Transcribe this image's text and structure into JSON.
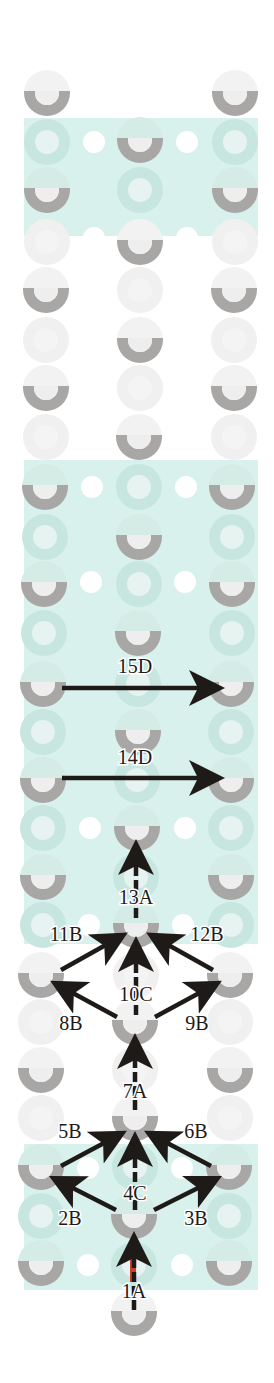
{
  "colors": {
    "background": "#ffffff",
    "band": "#d8f1ec",
    "band_shade": "#c9e9e2",
    "bead_solid": "#a9a7a6",
    "bead_hole": "#eeeeee",
    "bead_faded": "#f0f0f0",
    "bead_faded_in_band": "#c6e6df",
    "dot": "#ffffff",
    "arrow": "#1e1a18",
    "thread_tail": "#c8422b"
  },
  "bands": [
    {
      "y": 118,
      "h": 118
    },
    {
      "y": 460,
      "h": 484
    },
    {
      "y": 1144,
      "h": 146
    }
  ],
  "band_x": 24,
  "band_w": 234,
  "beads": [
    {
      "x": 47,
      "y": 93,
      "solid": true
    },
    {
      "x": 235,
      "y": 93,
      "solid": true
    },
    {
      "x": 140,
      "y": 140,
      "solid": true
    },
    {
      "x": 47,
      "y": 142,
      "solid": false
    },
    {
      "x": 235,
      "y": 142,
      "solid": false
    },
    {
      "x": 47,
      "y": 190,
      "solid": true
    },
    {
      "x": 235,
      "y": 190,
      "solid": true
    },
    {
      "x": 140,
      "y": 190,
      "solid": false
    },
    {
      "x": 140,
      "y": 242,
      "solid": true
    },
    {
      "x": 47,
      "y": 242,
      "solid": false
    },
    {
      "x": 235,
      "y": 242,
      "solid": false
    },
    {
      "x": 46,
      "y": 290,
      "solid": true
    },
    {
      "x": 234,
      "y": 290,
      "solid": true
    },
    {
      "x": 140,
      "y": 290,
      "solid": false
    },
    {
      "x": 140,
      "y": 340,
      "solid": true
    },
    {
      "x": 46,
      "y": 340,
      "solid": false
    },
    {
      "x": 234,
      "y": 340,
      "solid": false
    },
    {
      "x": 46,
      "y": 388,
      "solid": true
    },
    {
      "x": 234,
      "y": 388,
      "solid": true
    },
    {
      "x": 140,
      "y": 388,
      "solid": false
    },
    {
      "x": 139,
      "y": 437,
      "solid": true
    },
    {
      "x": 46,
      "y": 437,
      "solid": false
    },
    {
      "x": 234,
      "y": 437,
      "solid": false
    },
    {
      "x": 45,
      "y": 487,
      "solid": true
    },
    {
      "x": 232,
      "y": 487,
      "solid": true
    },
    {
      "x": 139,
      "y": 487,
      "solid": false
    },
    {
      "x": 139,
      "y": 537,
      "solid": true
    },
    {
      "x": 45,
      "y": 537,
      "solid": false
    },
    {
      "x": 232,
      "y": 537,
      "solid": false
    },
    {
      "x": 44,
      "y": 584,
      "solid": true
    },
    {
      "x": 232,
      "y": 584,
      "solid": true
    },
    {
      "x": 139,
      "y": 584,
      "solid": false
    },
    {
      "x": 138,
      "y": 633,
      "solid": true
    },
    {
      "x": 44,
      "y": 633,
      "solid": false
    },
    {
      "x": 232,
      "y": 633,
      "solid": false
    },
    {
      "x": 43,
      "y": 684,
      "solid": true
    },
    {
      "x": 231,
      "y": 684,
      "solid": true
    },
    {
      "x": 138,
      "y": 684,
      "solid": false
    },
    {
      "x": 138,
      "y": 732,
      "solid": true
    },
    {
      "x": 43,
      "y": 732,
      "solid": false
    },
    {
      "x": 231,
      "y": 732,
      "solid": false
    },
    {
      "x": 43,
      "y": 780,
      "solid": true
    },
    {
      "x": 231,
      "y": 780,
      "solid": true
    },
    {
      "x": 137,
      "y": 780,
      "solid": false
    },
    {
      "x": 137,
      "y": 828,
      "solid": true
    },
    {
      "x": 43,
      "y": 828,
      "solid": false
    },
    {
      "x": 231,
      "y": 828,
      "solid": false
    },
    {
      "x": 43,
      "y": 877,
      "solid": true
    },
    {
      "x": 231,
      "y": 877,
      "solid": true
    },
    {
      "x": 136,
      "y": 877,
      "solid": false
    },
    {
      "x": 136,
      "y": 925,
      "solid": true
    },
    {
      "x": 43,
      "y": 925,
      "solid": false
    },
    {
      "x": 231,
      "y": 925,
      "solid": false
    },
    {
      "x": 41,
      "y": 975,
      "solid": true
    },
    {
      "x": 230,
      "y": 975,
      "solid": true
    },
    {
      "x": 136,
      "y": 975,
      "solid": false
    },
    {
      "x": 135,
      "y": 1022,
      "solid": true
    },
    {
      "x": 41,
      "y": 1022,
      "solid": false
    },
    {
      "x": 230,
      "y": 1022,
      "solid": false
    },
    {
      "x": 41,
      "y": 1070,
      "solid": true
    },
    {
      "x": 230,
      "y": 1070,
      "solid": true
    },
    {
      "x": 135,
      "y": 1070,
      "solid": false
    },
    {
      "x": 135,
      "y": 1118,
      "solid": true
    },
    {
      "x": 41,
      "y": 1118,
      "solid": false
    },
    {
      "x": 230,
      "y": 1118,
      "solid": false
    },
    {
      "x": 41,
      "y": 1167,
      "solid": true
    },
    {
      "x": 229,
      "y": 1167,
      "solid": true
    },
    {
      "x": 135,
      "y": 1167,
      "solid": false
    },
    {
      "x": 134,
      "y": 1216,
      "solid": true
    },
    {
      "x": 41,
      "y": 1216,
      "solid": false
    },
    {
      "x": 229,
      "y": 1216,
      "solid": false
    },
    {
      "x": 41,
      "y": 1263,
      "solid": true
    },
    {
      "x": 229,
      "y": 1263,
      "solid": true
    },
    {
      "x": 134,
      "y": 1265,
      "solid": false
    },
    {
      "x": 134,
      "y": 1313,
      "solid": true
    }
  ],
  "dots": [
    {
      "x": 94,
      "y": 142
    },
    {
      "x": 187,
      "y": 142
    },
    {
      "x": 94,
      "y": 238
    },
    {
      "x": 187,
      "y": 238
    },
    {
      "x": 92,
      "y": 487
    },
    {
      "x": 186,
      "y": 487
    },
    {
      "x": 91,
      "y": 582
    },
    {
      "x": 185,
      "y": 582
    },
    {
      "x": 90,
      "y": 828
    },
    {
      "x": 185,
      "y": 828
    },
    {
      "x": 89,
      "y": 925
    },
    {
      "x": 183,
      "y": 925
    },
    {
      "x": 88,
      "y": 1168
    },
    {
      "x": 182,
      "y": 1168
    },
    {
      "x": 88,
      "y": 1265
    },
    {
      "x": 182,
      "y": 1265
    }
  ],
  "steps": [
    {
      "id": "1A",
      "label": "1A",
      "x1": 134,
      "y1": 1310,
      "x2": 134,
      "y2": 1240,
      "dashed": true,
      "lx": 134,
      "ly": 1298
    },
    {
      "id": "2B",
      "label": "2B",
      "x1": 116,
      "y1": 1210,
      "x2": 57,
      "y2": 1180,
      "dashed": false,
      "lx": 70,
      "ly": 1225
    },
    {
      "id": "3B",
      "label": "3B",
      "x1": 154,
      "y1": 1210,
      "x2": 214,
      "y2": 1180,
      "dashed": false,
      "lx": 196,
      "ly": 1225
    },
    {
      "id": "4C",
      "label": "4C",
      "x1": 135,
      "y1": 1210,
      "x2": 135,
      "y2": 1140,
      "dashed": true,
      "lx": 135,
      "ly": 1200
    },
    {
      "id": "5B",
      "label": "5B",
      "x1": 61,
      "y1": 1166,
      "x2": 119,
      "y2": 1135,
      "dashed": false,
      "lx": 70,
      "ly": 1138
    },
    {
      "id": "6B",
      "label": "6B",
      "x1": 211,
      "y1": 1166,
      "x2": 152,
      "y2": 1135,
      "dashed": false,
      "lx": 196,
      "ly": 1138
    },
    {
      "id": "7A",
      "label": "7A",
      "x1": 135,
      "y1": 1110,
      "x2": 135,
      "y2": 1042,
      "dashed": true,
      "lx": 135,
      "ly": 1098
    },
    {
      "id": "8B",
      "label": "8B",
      "x1": 117,
      "y1": 1017,
      "x2": 58,
      "y2": 985,
      "dashed": false,
      "lx": 71,
      "ly": 1030
    },
    {
      "id": "9B",
      "label": "9B",
      "x1": 155,
      "y1": 1017,
      "x2": 214,
      "y2": 985,
      "dashed": false,
      "lx": 197,
      "ly": 1030
    },
    {
      "id": "10C",
      "label": "10C",
      "x1": 136,
      "y1": 1015,
      "x2": 136,
      "y2": 945,
      "dashed": true,
      "lx": 136,
      "ly": 1001
    },
    {
      "id": "11B",
      "label": "11B",
      "x1": 61,
      "y1": 970,
      "x2": 120,
      "y2": 937,
      "dashed": false,
      "lx": 66,
      "ly": 941
    },
    {
      "id": "12B",
      "label": "12B",
      "x1": 213,
      "y1": 970,
      "x2": 154,
      "y2": 937,
      "dashed": false,
      "lx": 207,
      "ly": 941
    },
    {
      "id": "13A",
      "label": "13A",
      "x1": 136,
      "y1": 918,
      "x2": 136,
      "y2": 848,
      "dashed": true,
      "lx": 136,
      "ly": 904
    },
    {
      "id": "14D",
      "label": "14D",
      "x1": 62,
      "y1": 778,
      "x2": 216,
      "y2": 778,
      "dashed": false,
      "lx": 135,
      "ly": 764
    },
    {
      "id": "15D",
      "label": "15D",
      "x1": 62,
      "y1": 688,
      "x2": 216,
      "y2": 688,
      "dashed": false,
      "lx": 135,
      "ly": 673
    }
  ],
  "bead_radius": 23,
  "hole_radius": 12
}
